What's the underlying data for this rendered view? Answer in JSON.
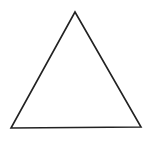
{
  "diagram": {
    "shape": "triangle",
    "stroke_color": "#222222",
    "fill_color": "#ffffff",
    "stroke_width": 1.6,
    "points": "75,12 11,128 141,127"
  }
}
